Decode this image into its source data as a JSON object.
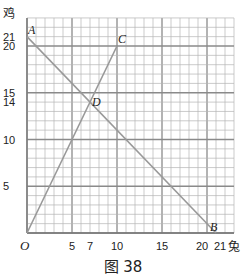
{
  "chart_data": {
    "type": "line",
    "title": "",
    "caption": "图 38",
    "xlabel": "兔",
    "ylabel": "鸡",
    "origin_label": "O",
    "xlim": [
      0,
      23
    ],
    "ylim": [
      0,
      23
    ],
    "x_ticks": [
      5,
      7,
      10,
      15,
      20,
      21
    ],
    "x_tick_labels": [
      "5",
      "7",
      "10",
      "15",
      "20",
      "21"
    ],
    "y_ticks": [
      5,
      10,
      14,
      15,
      20,
      21
    ],
    "y_tick_labels": [
      "5",
      "10",
      "14",
      "15",
      "20",
      "21"
    ],
    "grid": true,
    "series": [
      {
        "name": "AB",
        "points": [
          [
            0,
            21
          ],
          [
            21,
            0
          ]
        ],
        "color": "#999999"
      },
      {
        "name": "OC",
        "points": [
          [
            0,
            0
          ],
          [
            10,
            20
          ]
        ],
        "color": "#999999"
      }
    ],
    "points": [
      {
        "label": "A",
        "x": 0,
        "y": 21
      },
      {
        "label": "B",
        "x": 21,
        "y": 0
      },
      {
        "label": "C",
        "x": 10,
        "y": 20
      },
      {
        "label": "D",
        "x": 7,
        "y": 14
      }
    ]
  }
}
